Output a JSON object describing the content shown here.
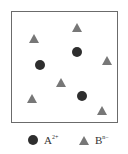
{
  "diagram": {
    "colors": {
      "cation": "#2e2e2e",
      "anion": "#777777",
      "border": "#6b6b6b"
    },
    "cations": [
      {
        "x": 77,
        "y": 52
      },
      {
        "x": 40,
        "y": 65
      },
      {
        "x": 82,
        "y": 96
      }
    ],
    "anions": [
      {
        "x": 77,
        "y": 28
      },
      {
        "x": 34,
        "y": 39
      },
      {
        "x": 107,
        "y": 61
      },
      {
        "x": 61,
        "y": 83
      },
      {
        "x": 32,
        "y": 99
      },
      {
        "x": 102,
        "y": 111
      }
    ]
  },
  "legend": {
    "cation": {
      "symbol": "A",
      "charge": "2+"
    },
    "anion": {
      "symbol": "B",
      "charge": "n−"
    }
  }
}
